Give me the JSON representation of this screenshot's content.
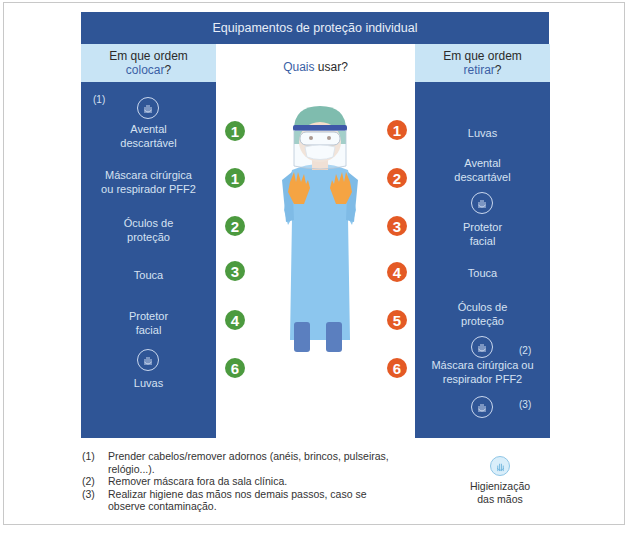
{
  "title": "Equipamentos de proteção individual",
  "left_column": {
    "header_line1": "Em que ordem",
    "header_accent": "colocar",
    "header_suffix": "?",
    "note_marker": "(1)",
    "items": [
      {
        "label_line1": "Avental",
        "label_line2": "descartável",
        "step": "1"
      },
      {
        "label_line1": "Máscara cirúrgica",
        "label_line2": "ou respirador PFF2",
        "step": "1"
      },
      {
        "label_line1": "Óculos de",
        "label_line2": "proteção",
        "step": "2"
      },
      {
        "label_line1": "Touca",
        "label_line2": "",
        "step": "3"
      },
      {
        "label_line1": "Protetor",
        "label_line2": "facial",
        "step": "4"
      },
      {
        "label_line1": "Luvas",
        "label_line2": "",
        "step": "6"
      }
    ]
  },
  "center": {
    "header_accent": "Quais",
    "header_rest": " usar?"
  },
  "right_column": {
    "header_line1": "Em que ordem",
    "header_accent": "retirar",
    "header_suffix": "?",
    "items": [
      {
        "label_line1": "Luvas",
        "label_line2": "",
        "step": "1"
      },
      {
        "label_line1": "Avental",
        "label_line2": "descartável",
        "step": "2"
      },
      {
        "label_line1": "Protetor",
        "label_line2": "facial",
        "step": "3"
      },
      {
        "label_line1": "Touca",
        "label_line2": "",
        "step": "4"
      },
      {
        "label_line1": "Óculos de",
        "label_line2": "proteção",
        "step": "5"
      },
      {
        "label_line1": "Máscara cirúrgica ou",
        "label_line2": "respirador PFF2",
        "step": "6"
      }
    ],
    "note_markers": [
      "(2)",
      "(3)"
    ]
  },
  "footnotes": [
    {
      "num": "(1)",
      "text": "Prender cabelos/remover adornos (anéis, brincos, pulseiras, relógio...)."
    },
    {
      "num": "(2)",
      "text": "Remover máscara fora da sala clínica."
    },
    {
      "num": "(3)",
      "text": "Realizar higiene das mãos nos demais passos, caso se observe contaminação."
    }
  ],
  "legend": {
    "icon": "hand-hygiene-icon",
    "label_line1": "Higienização",
    "label_line2": "das mãos"
  },
  "colors": {
    "dark_blue": "#2f5596",
    "light_blue": "#c8e4f5",
    "green": "#4c9a3f",
    "orange": "#e45a25",
    "gown": "#8cc6ee",
    "gloves": "#f5a443"
  }
}
